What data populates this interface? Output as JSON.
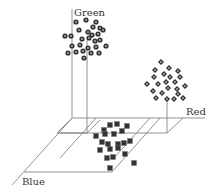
{
  "chart_data": {
    "type": "scatter",
    "title": "",
    "dimensions": 3,
    "axes": {
      "x": {
        "label": "Red"
      },
      "y": {
        "label": "Green"
      },
      "z": {
        "label": "Blue"
      }
    },
    "grid": false,
    "legend": null,
    "series": [
      {
        "name": "Green cluster",
        "marker": "circle",
        "points_2d": [
          [
            76,
            22
          ],
          [
            86,
            20
          ],
          [
            96,
            22
          ],
          [
            93,
            27
          ],
          [
            100,
            28
          ],
          [
            79,
            30
          ],
          [
            88,
            32
          ],
          [
            92,
            35
          ],
          [
            98,
            34
          ],
          [
            103,
            30
          ],
          [
            65,
            36
          ],
          [
            71,
            36
          ],
          [
            82,
            39
          ],
          [
            89,
            38
          ],
          [
            95,
            41
          ],
          [
            100,
            40
          ],
          [
            106,
            46
          ],
          [
            72,
            46
          ],
          [
            80,
            45
          ],
          [
            88,
            48
          ],
          [
            96,
            47
          ],
          [
            83,
            51
          ],
          [
            91,
            53
          ],
          [
            99,
            53
          ],
          [
            68,
            53
          ],
          [
            76,
            52
          ],
          [
            84,
            58
          ]
        ]
      },
      {
        "name": "Red cluster",
        "marker": "diamond",
        "points_2d": [
          [
            161,
            62
          ],
          [
            155,
            70
          ],
          [
            169,
            68
          ],
          [
            178,
            71
          ],
          [
            164,
            74
          ],
          [
            154,
            77
          ],
          [
            170,
            77
          ],
          [
            180,
            77
          ],
          [
            175,
            82
          ],
          [
            166,
            82
          ],
          [
            158,
            84
          ],
          [
            147,
            84
          ],
          [
            168,
            88
          ],
          [
            185,
            86
          ],
          [
            177,
            89
          ],
          [
            153,
            91
          ],
          [
            162,
            93
          ],
          [
            178,
            94
          ],
          [
            156,
            98
          ],
          [
            167,
            99
          ],
          [
            174,
            99
          ],
          [
            183,
            98
          ]
        ]
      },
      {
        "name": "Blue cluster",
        "marker": "square",
        "points_2d": [
          [
            110,
            125
          ],
          [
            117,
            124
          ],
          [
            127,
            126
          ],
          [
            104,
            130
          ],
          [
            122,
            131
          ],
          [
            96,
            136
          ],
          [
            105,
            134
          ],
          [
            114,
            134
          ],
          [
            102,
            142
          ],
          [
            108,
            144
          ],
          [
            118,
            144
          ],
          [
            124,
            143
          ],
          [
            130,
            141
          ],
          [
            100,
            150
          ],
          [
            110,
            149
          ],
          [
            118,
            148
          ],
          [
            125,
            154
          ],
          [
            107,
            158
          ],
          [
            113,
            157
          ],
          [
            110,
            168
          ],
          [
            134,
            163
          ]
        ]
      }
    ]
  },
  "labels": {
    "green": "Green",
    "red": "Red",
    "blue": "Blue"
  },
  "colors": {
    "axis": "#555555",
    "plane": "#888888",
    "marker_fill": "#333333",
    "marker_center": "#bbbbbb",
    "text": "#333333"
  }
}
